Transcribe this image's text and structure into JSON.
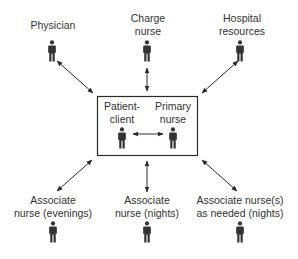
{
  "diagram": {
    "type": "organizational-relationship",
    "colors": {
      "stroke": "#2a2a2a",
      "figure": "#333333",
      "text": "#333333",
      "background": "#ffffff"
    },
    "center_box": {
      "nodes": [
        {
          "id": "patient",
          "line1": "Patient-",
          "line2": "client"
        },
        {
          "id": "primary",
          "line1": "Primary",
          "line2": "nurse"
        }
      ],
      "link": "bidirectional"
    },
    "outer_nodes": [
      {
        "id": "physician",
        "line1": "Physician",
        "line2": ""
      },
      {
        "id": "charge",
        "line1": "Charge",
        "line2": "nurse"
      },
      {
        "id": "hospital",
        "line1": "Hospital",
        "line2": "resources"
      },
      {
        "id": "assoc-evenings",
        "line1": "Associate",
        "line2": "nurse (evenings)"
      },
      {
        "id": "assoc-nights",
        "line1": "Associate",
        "line2": "nurse (nights)"
      },
      {
        "id": "assoc-needed",
        "line1": "Associate nurse(s)",
        "line2": "as needed (nights)"
      }
    ],
    "icon": "person-icon"
  }
}
